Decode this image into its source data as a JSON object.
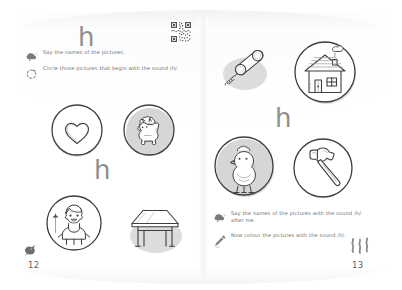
{
  "worksheet": {
    "letter": "h",
    "sound_label": "/h/",
    "qr_code": "qr-code"
  },
  "left_page": {
    "heading_letter": "h",
    "watermark_letter": "h",
    "page_number": "12",
    "instructions": [
      {
        "icon": "speech-bubble-icon",
        "text": "Say the names of the pictures."
      },
      {
        "icon": "circle-pencil-icon",
        "text": "Circle those pictures that begin with the sound /h/."
      }
    ],
    "pictures": [
      {
        "name": "heart",
        "label": "heart",
        "circled": true,
        "shaded": true
      },
      {
        "name": "horse",
        "label": "horse",
        "circled": true,
        "shaded": true
      },
      {
        "name": "boy",
        "label": "boy",
        "circled": true,
        "shaded": false
      },
      {
        "name": "table",
        "label": "table",
        "circled": false,
        "shaded": true
      }
    ],
    "decoration": "bird-icon"
  },
  "right_page": {
    "watermark_letter": "h",
    "page_number": "13",
    "instructions": [
      {
        "icon": "speech-bubble-icon",
        "text": "Say the names of the pictures with the sound /h/ after me."
      },
      {
        "icon": "colour-crayon-icon",
        "text": "Now colour the pictures with the sound /h/."
      }
    ],
    "pictures": [
      {
        "name": "telephone",
        "label": "telephone",
        "circled": false,
        "shaded": true
      },
      {
        "name": "house",
        "label": "house",
        "circled": true,
        "shaded": true
      },
      {
        "name": "hen",
        "label": "hen",
        "circled": true,
        "shaded": true
      },
      {
        "name": "hammer",
        "label": "hammer",
        "circled": true,
        "shaded": false
      }
    ],
    "decoration": "steam-squiggle-icon"
  },
  "colors": {
    "ink": "#4a4a4a",
    "text": "#6f6f6f",
    "watermark": "#8e8e8e",
    "shadow": "#d9d9d9",
    "paper": "#ffffff"
  }
}
